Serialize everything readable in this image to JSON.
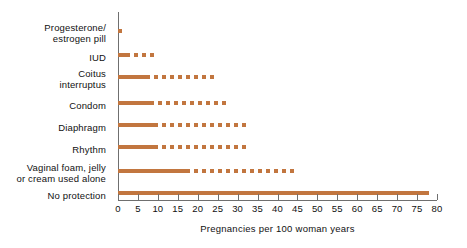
{
  "chart_data": {
    "type": "bar",
    "orientation": "horizontal",
    "title": "",
    "xlabel": "Pregnancies per 100 woman years",
    "ylabel": "",
    "xlim": [
      0,
      80
    ],
    "xticks": [
      0,
      5,
      10,
      15,
      20,
      25,
      30,
      35,
      40,
      45,
      50,
      55,
      60,
      65,
      70,
      75,
      80
    ],
    "grid": false,
    "legend": null,
    "bar_color": "#c2763f",
    "axis_color": "#6f6f6f",
    "note": "Each bar shows a range: a solid segment up to the lower value, then a dashed segment continuing to the upper value.",
    "categories": [
      "Progesterone/\nestrogen pill",
      "IUD",
      "Coitus\ninterruptus",
      "Condom",
      "Diaphragm",
      "Rhythm",
      "Vaginal foam, jelly\nor cream used alone",
      "No protection"
    ],
    "values": [
      1,
      9,
      25,
      28,
      33,
      33,
      45,
      78
    ],
    "series": [
      {
        "name": "solid segment (lower estimate)",
        "values": [
          1,
          2,
          7,
          8,
          9,
          9,
          17,
          78
        ]
      },
      {
        "name": "dashed segment end (upper estimate)",
        "values": [
          1,
          9,
          25,
          28,
          33,
          33,
          45,
          78
        ]
      }
    ]
  },
  "axis": {
    "tick_labels": [
      "0",
      "5",
      "10",
      "15",
      "20",
      "25",
      "30",
      "35",
      "40",
      "45",
      "50",
      "55",
      "60",
      "65",
      "70",
      "75",
      "80"
    ],
    "x_title": "Pregnancies per 100 woman years"
  },
  "labels": {
    "items": [
      "Progesterone/\nestrogen pill",
      "IUD",
      "Coitus\ninterruptus",
      "Condom",
      "Diaphragm",
      "Rhythm",
      "Vaginal foam, jelly\nor cream used alone",
      "No protection"
    ]
  }
}
